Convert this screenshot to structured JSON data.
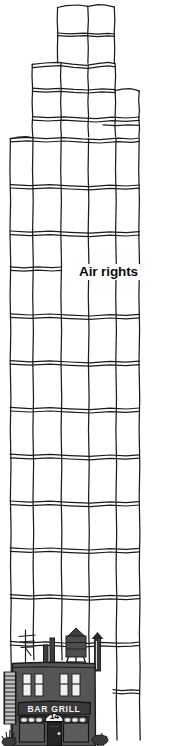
{
  "illustration": {
    "kind": "architectural-sketch",
    "title": "Air rights over a low-rise building",
    "annotation": {
      "text": "Air rights",
      "position": {
        "x": 77,
        "y": 264
      }
    },
    "palette": {
      "background": "#ffffff",
      "ink": "#1a1a1a",
      "building_fill": "#4d4d4d",
      "building_dark": "#2b2b2b",
      "window_light": "#f2f2f2",
      "sign_fill": "#3a3a3a",
      "awning_fill": "#e8e8e8"
    },
    "ghost_tower": {
      "description": "outlined setback tower showing unbuilt volume",
      "tiers": [
        {
          "name": "crown-tier",
          "left": 57,
          "right": 114,
          "top": 5
        },
        {
          "name": "upper-setback-tier",
          "left": 32,
          "right": 115,
          "top": 63
        },
        {
          "name": "mid-setback-tier",
          "left": 32,
          "right": 139,
          "top": 89
        },
        {
          "name": "main-shaft",
          "left": 10,
          "right": 139,
          "top": 137
        }
      ],
      "floor_band_y": [
        5,
        34,
        63,
        89,
        117,
        137,
        185,
        232,
        268,
        315,
        362,
        409,
        456,
        503,
        550,
        597,
        644,
        691,
        738
      ],
      "column_x": [
        10,
        33,
        61,
        88,
        117,
        140
      ]
    },
    "low_rise_building": {
      "name": "Bar & Grill building",
      "sign_text": "BAR GRILL",
      "address_number": "14",
      "features": [
        "water-tower",
        "tv-antenna",
        "chimney-pipes",
        "vent-stack",
        "fire-escape-ladder",
        "upper-windows",
        "storefront-awnings",
        "entry-door",
        "sidewalk-shrubs"
      ],
      "bounds": {
        "left": 8,
        "top": 660,
        "right": 112,
        "bottom": 746
      }
    }
  }
}
